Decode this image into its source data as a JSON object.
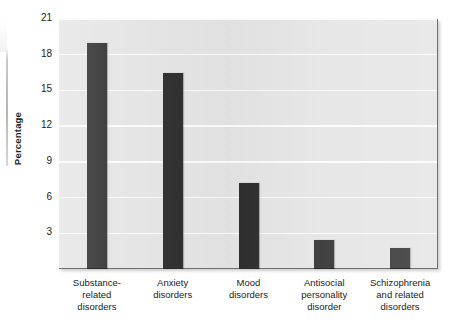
{
  "figure": {
    "name": "mental-disorder-prevalence-bar-chart"
  },
  "axis": {
    "ylabel": "Percentage",
    "yticks": [
      "21",
      "18",
      "15",
      "12",
      "9",
      "6",
      "3"
    ]
  },
  "categories": [
    {
      "lines": [
        "Substance-",
        "related",
        "disorders"
      ]
    },
    {
      "lines": [
        "Anxiety",
        "disorders"
      ]
    },
    {
      "lines": [
        "Mood",
        "disorders"
      ]
    },
    {
      "lines": [
        "Antisocial",
        "personality",
        "disorder"
      ]
    },
    {
      "lines": [
        "Schizophrenia",
        "and related",
        "disorders"
      ]
    }
  ],
  "colors": {
    "bar": "#2c2c2c",
    "plot_background": "#e4e4e4",
    "gridline": "#fbfbfb",
    "text": "#1b1b1b",
    "page_background": "#ffffff"
  },
  "chart_data": {
    "type": "bar",
    "title": "",
    "xlabel": "",
    "ylabel": "Percentage",
    "categories": [
      "Substance-related disorders",
      "Anxiety disorders",
      "Mood disorders",
      "Antisocial personality disorder",
      "Schizophrenia and related disorders"
    ],
    "values": [
      19.0,
      16.5,
      7.2,
      2.4,
      1.8
    ],
    "ylim": [
      0,
      21
    ],
    "ytick_values": [
      3,
      6,
      9,
      12,
      15,
      18,
      21
    ],
    "grid": true,
    "legend": false
  }
}
